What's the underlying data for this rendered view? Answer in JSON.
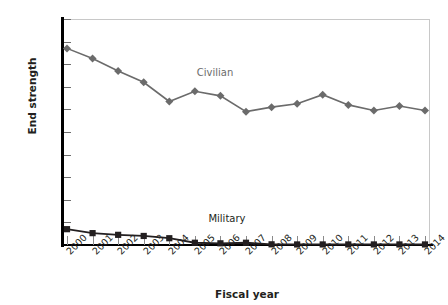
{
  "chart_data": {
    "type": "line",
    "title": "",
    "xlabel": "Fiscal year",
    "ylabel": "End strength",
    "categories": [
      "2000",
      "2001",
      "2002",
      "2003",
      "2004",
      "2005",
      "2006",
      "2007",
      "2008",
      "2009",
      "2010",
      "2011",
      "2012",
      "2013",
      "2014"
    ],
    "ylim": [
      0,
      20000
    ],
    "ytick_labels": [
      "20,000",
      "18,000",
      "16,000",
      "14,000",
      "12,000",
      "10,000",
      "8,000",
      "6,000",
      "4,000",
      "2,000",
      "0"
    ],
    "ytick_values": [
      20000,
      18000,
      16000,
      14000,
      12000,
      10000,
      8000,
      6000,
      4000,
      2000,
      0
    ],
    "grid": false,
    "legend_position": "inline-annotations",
    "series": [
      {
        "name": "Civilian",
        "color": "#6b6b6b",
        "marker": "diamond",
        "values": [
          17400,
          16500,
          15400,
          14400,
          12700,
          13600,
          13200,
          11800,
          12200,
          12500,
          13300,
          12400,
          11900,
          12300,
          11900
        ]
      },
      {
        "name": "Military",
        "color": "#231f20",
        "marker": "square",
        "values": [
          1400,
          1050,
          900,
          800,
          600,
          200,
          150,
          200,
          60,
          50,
          50,
          50,
          50,
          50,
          50
        ]
      }
    ],
    "annotations": [
      {
        "text": "Civilian",
        "series": "Civilian"
      },
      {
        "text": "Military",
        "series": "Military"
      }
    ]
  }
}
